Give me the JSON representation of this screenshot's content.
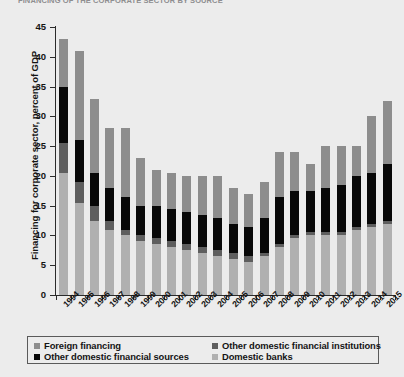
{
  "title": "FINANCING OF THE CORPORATE SECTOR BY SOURCE",
  "chart_data": {
    "type": "bar",
    "subtype": "stacked-bar",
    "title": "FINANCING OF THE CORPORATE SECTOR BY SOURCE",
    "xlabel": "",
    "ylabel": "Financing for corporate sector, percent of GDP",
    "ylim": [
      0,
      45
    ],
    "yticks": [
      0,
      5,
      10,
      15,
      20,
      25,
      30,
      35,
      40,
      45
    ],
    "ytick_labels": [
      "0",
      "5",
      "10",
      "15",
      "20",
      "25",
      "30",
      "35",
      "40",
      "45"
    ],
    "grid": false,
    "legend_position": "bottom",
    "categories": [
      "1994",
      "1995",
      "1996",
      "1997",
      "1998",
      "1999",
      "2000",
      "2001",
      "2002",
      "2003",
      "2004",
      "2005",
      "2006",
      "2007",
      "2008",
      "2009",
      "2010",
      "2011",
      "2012",
      "2013",
      "2014",
      "2015"
    ],
    "series": [
      {
        "name": "Domestic banks",
        "color": "#b0b0b0",
        "stack_order": 1,
        "values": [
          20.5,
          15.5,
          12.5,
          11.0,
          10.0,
          9.0,
          8.5,
          8.0,
          7.5,
          7.0,
          6.5,
          6.0,
          5.5,
          6.5,
          8.0,
          9.5,
          10.0,
          10.0,
          10.0,
          11.0,
          11.5,
          12.0
        ]
      },
      {
        "name": "Other domestic financial institutions",
        "color": "#5e5e5e",
        "stack_order": 2,
        "values": [
          5.0,
          3.5,
          2.5,
          1.5,
          1.0,
          1.0,
          1.0,
          1.0,
          1.0,
          1.0,
          1.0,
          1.0,
          1.0,
          0.5,
          0.5,
          0.5,
          0.5,
          0.5,
          0.5,
          0.5,
          0.5,
          0.5
        ]
      },
      {
        "name": "Other domestic financial sources",
        "color": "#080808",
        "stack_order": 3,
        "values": [
          9.5,
          7.0,
          5.5,
          5.5,
          5.5,
          5.0,
          5.5,
          5.5,
          5.5,
          5.5,
          5.5,
          5.0,
          5.0,
          6.0,
          8.0,
          7.5,
          7.0,
          7.5,
          8.0,
          8.5,
          8.5,
          9.5
        ]
      },
      {
        "name": "Foreign financing",
        "color": "#8d8d8d",
        "stack_order": 4,
        "values": [
          8.0,
          15.0,
          12.5,
          10.0,
          11.5,
          8.0,
          6.0,
          6.0,
          6.0,
          6.5,
          7.0,
          6.0,
          5.5,
          6.0,
          7.5,
          6.5,
          4.5,
          7.0,
          6.5,
          5.0,
          9.5,
          10.5
        ]
      }
    ],
    "totals": [
      43.0,
      41.0,
      33.0,
      28.0,
      28.0,
      23.0,
      21.0,
      20.5,
      20.0,
      20.0,
      20.0,
      18.0,
      17.0,
      19.0,
      24.0,
      24.0,
      22.0,
      25.0,
      25.0,
      25.0,
      30.0,
      32.5
    ]
  },
  "legend": {
    "items": [
      {
        "label": "Foreign financing",
        "color": "#8d8d8d"
      },
      {
        "label": "Other domestic financial institutions",
        "color": "#5e5e5e"
      },
      {
        "label": "Other domestic financial sources",
        "color": "#080808"
      },
      {
        "label": "Domestic banks",
        "color": "#b0b0b0"
      }
    ]
  }
}
